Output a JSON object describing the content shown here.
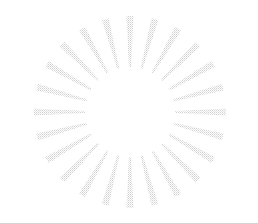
{
  "image": {
    "kind": "sunburst-ray-graphic",
    "width": 258,
    "height": 223,
    "background_color": "#ffffff",
    "alt_text": "Faded light-gray starburst of radiating tapered rays on a white background"
  },
  "burst": {
    "name": "starburst",
    "center_x": 130,
    "center_y": 112,
    "ray_count": 24,
    "inner_radius": 45,
    "outer_radius": 96,
    "angle_step_deg": 15,
    "start_angle_deg": -90,
    "inner_width": 2.1,
    "outer_width": 7.0,
    "ray_color": "#d2d2d2",
    "ray_color_light": "#ececec",
    "ray_opacity": 0.85,
    "texture": "halftone-dither",
    "texture_dot_size": 1,
    "texture_spacing": 2
  },
  "rays": [
    {
      "index": 0,
      "angle_deg": -90,
      "label": "ray-000"
    },
    {
      "index": 1,
      "angle_deg": -75,
      "label": "ray-015"
    },
    {
      "index": 2,
      "angle_deg": -60,
      "label": "ray-030"
    },
    {
      "index": 3,
      "angle_deg": -45,
      "label": "ray-045"
    },
    {
      "index": 4,
      "angle_deg": -30,
      "label": "ray-060"
    },
    {
      "index": 5,
      "angle_deg": -15,
      "label": "ray-075"
    },
    {
      "index": 6,
      "angle_deg": 0,
      "label": "ray-090"
    },
    {
      "index": 7,
      "angle_deg": 15,
      "label": "ray-105"
    },
    {
      "index": 8,
      "angle_deg": 30,
      "label": "ray-120"
    },
    {
      "index": 9,
      "angle_deg": 45,
      "label": "ray-135"
    },
    {
      "index": 10,
      "angle_deg": 60,
      "label": "ray-150"
    },
    {
      "index": 11,
      "angle_deg": 75,
      "label": "ray-165"
    },
    {
      "index": 12,
      "angle_deg": 90,
      "label": "ray-180"
    },
    {
      "index": 13,
      "angle_deg": 105,
      "label": "ray-195"
    },
    {
      "index": 14,
      "angle_deg": 120,
      "label": "ray-210"
    },
    {
      "index": 15,
      "angle_deg": 135,
      "label": "ray-225"
    },
    {
      "index": 16,
      "angle_deg": 150,
      "label": "ray-240"
    },
    {
      "index": 17,
      "angle_deg": 165,
      "label": "ray-255"
    },
    {
      "index": 18,
      "angle_deg": 180,
      "label": "ray-270"
    },
    {
      "index": 19,
      "angle_deg": 195,
      "label": "ray-285"
    },
    {
      "index": 20,
      "angle_deg": 210,
      "label": "ray-300"
    },
    {
      "index": 21,
      "angle_deg": 225,
      "label": "ray-315"
    },
    {
      "index": 22,
      "angle_deg": 240,
      "label": "ray-330"
    },
    {
      "index": 23,
      "angle_deg": 255,
      "label": "ray-345"
    }
  ]
}
